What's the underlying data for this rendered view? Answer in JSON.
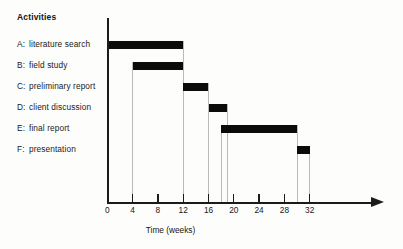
{
  "heading": "Activities",
  "chart_data": {
    "type": "bar",
    "title": "",
    "xlabel": "Time (weeks)",
    "ylabel": "Activities",
    "xlim": [
      0,
      34
    ],
    "ylim": [
      0,
      6
    ],
    "grid": true,
    "legend": "none",
    "orientation": "horizontal-gantt",
    "categories": [
      "A: literature search",
      "B: field study",
      "C: preliminary report",
      "D: client discussion",
      "E: final report",
      "F: presentation"
    ],
    "tasks": [
      {
        "code": "A",
        "name": "literature search",
        "label": "A: literature search",
        "start": 0,
        "end": 12,
        "duration": 12
      },
      {
        "code": "B",
        "name": "field study",
        "label": "B: field study",
        "start": 4,
        "end": 12,
        "duration": 8
      },
      {
        "code": "C",
        "name": "preliminary report",
        "label": "C: preliminary report",
        "start": 12,
        "end": 16,
        "duration": 4
      },
      {
        "code": "D",
        "name": "client discussion",
        "label": "D: client discussion",
        "start": 16,
        "end": 19,
        "duration": 3
      },
      {
        "code": "E",
        "name": "final report",
        "label": "E: final report",
        "start": 18,
        "end": 30,
        "duration": 12
      },
      {
        "code": "F",
        "name": "presentation",
        "label": "F: presentation",
        "start": 30,
        "end": 32,
        "duration": 2
      }
    ],
    "tick_values": [
      0,
      4,
      8,
      12,
      16,
      20,
      24,
      28,
      32
    ],
    "tick_labels": [
      "0",
      "4",
      "8",
      "12",
      "16",
      "20",
      "24",
      "28",
      "32"
    ],
    "gridline_values": [
      4,
      12,
      16,
      19,
      30,
      32
    ],
    "colors": {
      "bar": "#0b0b0b",
      "axis": "#1b1b1b",
      "gridline": "#b9b9b9",
      "text": "#151515",
      "background": "#ffffff"
    }
  }
}
